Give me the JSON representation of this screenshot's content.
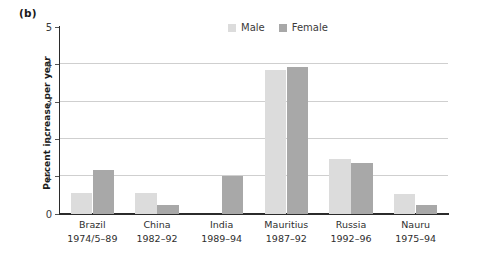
{
  "panel": {
    "label": "(b)"
  },
  "legend": {
    "position": "top-right",
    "entries": [
      {
        "label": "Male",
        "color": "#dcdcdc"
      },
      {
        "label": "Female",
        "color": "#a8a8a8"
      }
    ]
  },
  "chart_data": {
    "type": "bar",
    "title": "",
    "subtitle": "",
    "xlabel": "",
    "ylabel": "Percent increase per year",
    "ylim": [
      0,
      5
    ],
    "yticks": [
      0,
      1,
      2,
      3,
      4,
      5
    ],
    "ytick_labels": [
      "0",
      "1",
      "2",
      "3",
      "4",
      "5"
    ],
    "grid": "horizontal",
    "legend_position": "top-right",
    "categories": [
      "Brazil",
      "China",
      "India",
      "Mauritius",
      "Russia",
      "Nauru"
    ],
    "category_periods": [
      "1974/5–89",
      "1982–92",
      "1989–94",
      "1987–92",
      "1992–96",
      "1975–94"
    ],
    "category_labels": [
      "Brazil 1974/5–89",
      "China 1982–92",
      "India 1989–94",
      "Mauritius 1987–92",
      "Russia 1992–96",
      "Nauru 1975–94"
    ],
    "series": [
      {
        "name": "Male",
        "color": "#dcdcdc",
        "values": [
          0.55,
          0.54,
          null,
          3.85,
          1.47,
          0.52
        ]
      },
      {
        "name": "Female",
        "color": "#a8a8a8",
        "values": [
          1.17,
          0.22,
          1.01,
          3.93,
          1.35,
          0.22
        ]
      }
    ]
  },
  "colors": {
    "male_bar": "#dcdcdc",
    "female_bar": "#a8a8a8",
    "axis": "#2b2b2b",
    "gridline": "#cfcfcf",
    "text": "#2e2e2e",
    "background": "#ffffff"
  }
}
